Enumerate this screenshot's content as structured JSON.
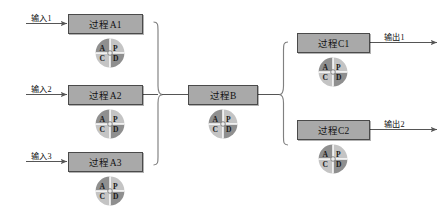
{
  "diagram": {
    "colors": {
      "box_fill": "#a9a9a9",
      "box_stroke": "#4a4a4a",
      "line": "#555555",
      "circle_dark": "#8f8f8f",
      "circle_light": "#c9c9c9",
      "text": "#111111",
      "background": "#ffffff"
    },
    "inputs": [
      {
        "label": "输入1"
      },
      {
        "label": "输入2"
      },
      {
        "label": "输入3"
      }
    ],
    "outputs": [
      {
        "label": "输出1"
      },
      {
        "label": "输出2"
      }
    ],
    "nodes": [
      {
        "id": "a1",
        "label": "过程A1"
      },
      {
        "id": "a2",
        "label": "过程A2"
      },
      {
        "id": "a3",
        "label": "过程A3"
      },
      {
        "id": "b",
        "label": "过程B"
      },
      {
        "id": "c1",
        "label": "过程C1"
      },
      {
        "id": "c2",
        "label": "过程C2"
      }
    ],
    "pdca": {
      "name": "PDCA cycle",
      "quadrants": {
        "top_left": "A",
        "top_right": "P",
        "bottom_left": "C",
        "bottom_right": "D"
      }
    }
  }
}
